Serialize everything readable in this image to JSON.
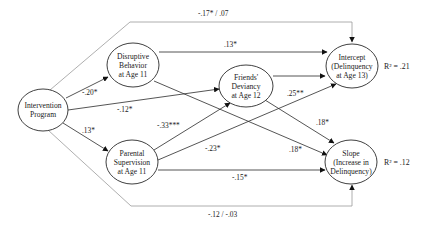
{
  "diagram": {
    "type": "path-model",
    "nodes": [
      {
        "id": "intervention",
        "lines": [
          "Intervention",
          "Program"
        ]
      },
      {
        "id": "disruptive",
        "lines": [
          "Disruptive",
          "Behavior",
          "at Age 11"
        ]
      },
      {
        "id": "parental",
        "lines": [
          "Parental",
          "Supervision",
          "at Age 11"
        ]
      },
      {
        "id": "friends",
        "lines": [
          "Friends'",
          "Deviancy",
          "at Age 12"
        ]
      },
      {
        "id": "intercept",
        "lines": [
          "Intercept",
          "(Delinquency",
          "at Age 13)"
        ],
        "r2": "R² = .21"
      },
      {
        "id": "slope",
        "lines": [
          "Slope",
          "(Increase in",
          "Delinquency)"
        ],
        "r2": "R² = .12"
      }
    ],
    "edges": [
      {
        "from": "intervention",
        "to": "intercept",
        "label": "-.17* / .07",
        "style": "direct-effect-gray"
      },
      {
        "from": "intervention",
        "to": "slope",
        "label": "-.12 / -.03",
        "style": "direct-effect-gray"
      },
      {
        "from": "intervention",
        "to": "disruptive",
        "label": "-.20*"
      },
      {
        "from": "intervention",
        "to": "friends",
        "label": "-.12*"
      },
      {
        "from": "intervention",
        "to": "parental",
        "label": ".13*"
      },
      {
        "from": "disruptive",
        "to": "intercept",
        "label": ".13*"
      },
      {
        "from": "disruptive",
        "to": "slope",
        "label": ".18*"
      },
      {
        "from": "parental",
        "to": "friends",
        "label": "-.33***"
      },
      {
        "from": "parental",
        "to": "intercept",
        "label": "-.23*"
      },
      {
        "from": "parental",
        "to": "slope",
        "label": "-.15*"
      },
      {
        "from": "friends",
        "to": "intercept",
        "label": ".25**"
      },
      {
        "from": "friends",
        "to": "slope",
        "label": ".18*"
      }
    ]
  },
  "colors": {
    "line": "#2a2a2a",
    "direct_line": "#9a9a9a",
    "background": "#ffffff"
  }
}
